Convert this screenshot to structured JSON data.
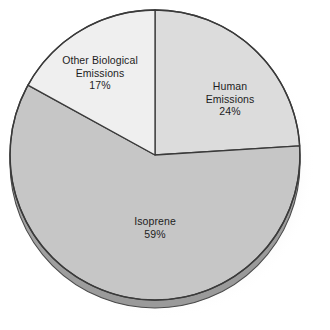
{
  "chart_data": {
    "type": "pie",
    "title": "",
    "subtitle": "",
    "xlabel": "",
    "ylabel": "",
    "legend_position": "none",
    "labels_inside_slices": true,
    "grid": false,
    "units": "percent",
    "total": 100,
    "categories": [
      "Human Emissions",
      "Isoprene",
      "Other Biological Emissions"
    ],
    "values": [
      24,
      59,
      17
    ],
    "slices": [
      {
        "label": "Human Emissions",
        "label_line1": "Human",
        "label_line2": "Emissions",
        "value": 24,
        "value_text": "24%",
        "color": "#dcdcdc",
        "start_angle_deg": 0,
        "end_angle_deg": 86.4
      },
      {
        "label": "Isoprene",
        "label_line1": "Isoprene",
        "label_line2": "",
        "value": 59,
        "value_text": "59%",
        "color": "#c6c6c6",
        "start_angle_deg": 86.4,
        "end_angle_deg": 298.8
      },
      {
        "label": "Other Biological Emissions",
        "label_line1": "Other Biological",
        "label_line2": "Emissions",
        "value": 17,
        "value_text": "17%",
        "color": "#efefef",
        "start_angle_deg": 298.8,
        "end_angle_deg": 360
      }
    ]
  },
  "style": {
    "background": "#ffffff",
    "outline_color": "#3a3a3a",
    "depth_color": "#a9a9a9",
    "shadow_color": "#cfcfcf",
    "label_color": "#1d1d1d"
  }
}
